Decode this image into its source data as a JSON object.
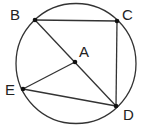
{
  "diagram": {
    "type": "geometry-circle",
    "circle": {
      "cx": 76,
      "cy": 63.5,
      "r": 60,
      "stroke": "#333333"
    },
    "points": [
      {
        "name": "A",
        "x": 75,
        "y": 62,
        "label": "A",
        "label_x": 79,
        "label_y": 57
      },
      {
        "name": "B",
        "x": 35,
        "y": 20,
        "label": "B",
        "label_x": 10,
        "label_y": 20
      },
      {
        "name": "C",
        "x": 117,
        "y": 21,
        "label": "C",
        "label_x": 122,
        "label_y": 20
      },
      {
        "name": "D",
        "x": 116,
        "y": 106,
        "label": "D",
        "label_x": 123,
        "label_y": 120
      },
      {
        "name": "E",
        "x": 23,
        "y": 89,
        "label": "E",
        "label_x": 5,
        "label_y": 95
      }
    ],
    "segments": [
      {
        "from": "B",
        "to": "C"
      },
      {
        "from": "C",
        "to": "D"
      },
      {
        "from": "B",
        "to": "D"
      },
      {
        "from": "A",
        "to": "E"
      },
      {
        "from": "E",
        "to": "D"
      }
    ]
  }
}
